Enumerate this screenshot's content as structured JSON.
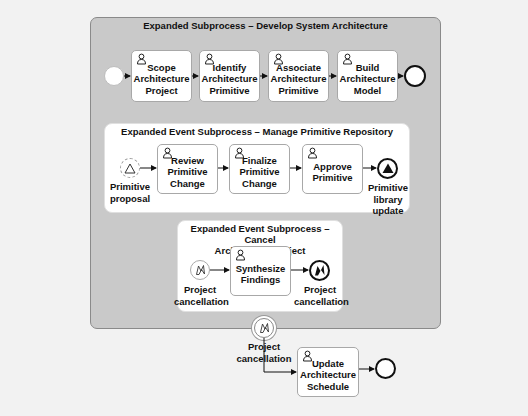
{
  "diagram": {
    "type": "BPMN",
    "outer_subprocess": {
      "title": "Expanded Subprocess – Develop System Architecture",
      "tasks": [
        {
          "label": "Scope Architecture Project",
          "lines": [
            "Scope",
            "Architecture",
            "Project"
          ],
          "type": "user-task"
        },
        {
          "label": "Identify Architecture Primitive",
          "lines": [
            "Identify",
            "Architecture",
            "Primitive"
          ],
          "type": "user-task"
        },
        {
          "label": "Associate Architecture Primitive",
          "lines": [
            "Associate",
            "Architecture",
            "Primitive"
          ],
          "type": "user-task"
        },
        {
          "label": "Build Architecture Model",
          "lines": [
            "Build",
            "Architecture",
            "Model"
          ],
          "type": "user-task"
        }
      ],
      "start_event": {
        "type": "none-start"
      },
      "end_event": {
        "type": "none-end"
      }
    },
    "event_subprocess_1": {
      "title": "Expanded Event Subprocess – Manage Primitive Repository",
      "start_event": {
        "type": "signal-start-non-interrupting",
        "lines": [
          "Primitive",
          "proposal"
        ]
      },
      "tasks": [
        {
          "label": "Review Primitive Change",
          "lines": [
            "Review",
            "Primitive",
            "Change"
          ],
          "type": "user-task"
        },
        {
          "label": "Finalize Primitive Change",
          "lines": [
            "Finalize",
            "Primitive",
            "Change"
          ],
          "type": "user-task"
        },
        {
          "label": "Approve Primitive",
          "lines": [
            "Approve",
            "Primitive"
          ],
          "type": "user-task"
        }
      ],
      "end_event": {
        "type": "signal-end",
        "lines": [
          "Primitive",
          "library",
          "update"
        ]
      }
    },
    "event_subprocess_2": {
      "title_lines": [
        "Expanded Event Subprocess – Cancel",
        "Architecture Project"
      ],
      "start_event": {
        "type": "error-start",
        "lines": [
          "Project",
          "cancellation"
        ]
      },
      "tasks": [
        {
          "label": "Synthesize Findings",
          "lines": [
            "Synthesize",
            "Findings"
          ],
          "type": "user-task"
        }
      ],
      "end_event": {
        "type": "error-end",
        "lines": [
          "Project",
          "cancellation"
        ]
      }
    },
    "boundary_event": {
      "type": "error-boundary",
      "lines": [
        "Project",
        "cancellation"
      ]
    },
    "after_task": {
      "label": "Update Architecture Schedule",
      "lines": [
        "Update",
        "Architecture",
        "Schedule"
      ],
      "type": "user-task"
    },
    "final_end_event": {
      "type": "none-end"
    },
    "colors": {
      "canvas": "#f2f2f2",
      "subprocess_fill": "#c9c9c9",
      "task_fill": "#ffffff",
      "stroke": "#111111"
    }
  }
}
